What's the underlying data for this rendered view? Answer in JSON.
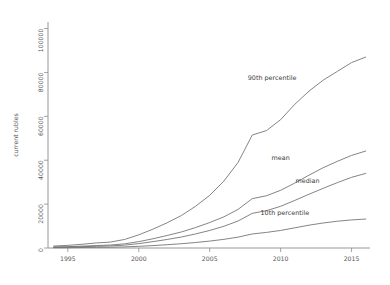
{
  "chart_data": {
    "type": "line",
    "title": "",
    "subtitle": "",
    "xlabel": "",
    "ylabel": "current rubles",
    "xlim": [
      1993.6,
      2016.3
    ],
    "ylim": [
      0,
      103000
    ],
    "grid": false,
    "legend_position": "inline-annotations",
    "x_ticks": [
      1995,
      2000,
      2005,
      2010,
      2015
    ],
    "x_tick_labels": [
      "1995",
      "2000",
      "2005",
      "2010",
      "2015"
    ],
    "y_ticks": [
      0,
      20000,
      40000,
      60000,
      80000,
      100000
    ],
    "y_tick_labels": [
      "0",
      "20000",
      "40000",
      "60000",
      "80000",
      "100000"
    ],
    "x": [
      1994,
      1995,
      1996,
      1997,
      1998,
      1999,
      2000,
      2001,
      2002,
      2003,
      2004,
      2005,
      2006,
      2007,
      2008,
      2009,
      2010,
      2011,
      2012,
      2013,
      2014,
      2015,
      2016
    ],
    "series": [
      {
        "name": "90th percentile",
        "label": "90th percentile",
        "color": "#6e6e6e",
        "label_x": 2009.4,
        "label_y": 76500,
        "values": [
          900,
          1200,
          1700,
          2300,
          2700,
          3900,
          6000,
          8600,
          11500,
          14800,
          19000,
          24000,
          30500,
          39000,
          51500,
          53500,
          58500,
          65500,
          71500,
          76500,
          80500,
          84500,
          87000
        ]
      },
      {
        "name": "mean",
        "label": "mean",
        "color": "#6e6e6e",
        "label_x": 2010.0,
        "label_y": 40200,
        "values": [
          450,
          600,
          850,
          1100,
          1350,
          1900,
          2900,
          4200,
          5700,
          7300,
          9300,
          11600,
          14200,
          17600,
          22500,
          23800,
          26300,
          29600,
          33200,
          36600,
          39500,
          42200,
          44200
        ]
      },
      {
        "name": "median",
        "label": "median",
        "color": "#4a4a4a",
        "label_x": 2011.9,
        "label_y": 29800,
        "values": [
          320,
          420,
          600,
          780,
          950,
          1300,
          2000,
          2900,
          3900,
          5000,
          6400,
          8000,
          9900,
          12300,
          15800,
          17000,
          19000,
          21700,
          24500,
          27200,
          29800,
          32200,
          34000
        ]
      },
      {
        "name": "10th percentile",
        "label": "10th percentile",
        "color": "#4a4a4a",
        "label_x": 2010.3,
        "label_y": 15200,
        "values": [
          120,
          160,
          230,
          300,
          360,
          500,
          760,
          1100,
          1500,
          1950,
          2500,
          3150,
          3950,
          4950,
          6400,
          7100,
          8000,
          9200,
          10400,
          11400,
          12200,
          12800,
          13200
        ]
      }
    ]
  },
  "figure": {
    "background": "#ffffff",
    "plot_background": "#ffffff",
    "axis_color": "#8d8d8d"
  }
}
